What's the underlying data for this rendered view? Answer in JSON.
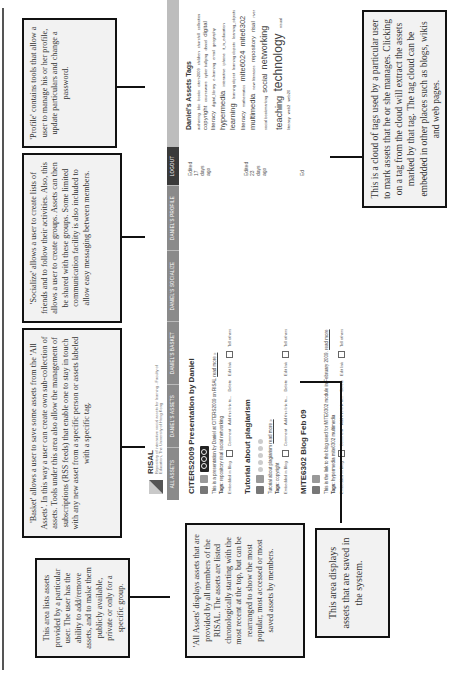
{
  "annotations": {
    "profile": "'Profile' contains tools that allow a user to manage his or her profile, update particulars and change a password.",
    "socialize": "'Socialize' allows a user to create lists of friends and to follow their activities. Also, this allows a user to create groups. Assets can then be shared with these groups. Some limited communication facility is also included to allow easy messaging between members.",
    "basket": "'Basket' allows a user to save some assets from the 'All Assets'. In this way a user can create own sub-collection of assets. Tools under this area also allow the management of subscriptions (RSS feeds) that enable one to stay in touch with any new asset from a specific person or assets labeled with a specific tag.",
    "my_assets": "This area lists assets provided by a particular user. The user has the ability to add/remove assets, and to make them publicly available, private or only for a specific group.",
    "all_assets": "'All Assets' displays assets that are provided by all members of the RISAL. The assets are listed chronologically starting with the most recent at the top, but can be rearranged to show the most popular, most accessed or most saved assets by members.",
    "saved_area": "This area displays assets that are saved in the system.",
    "tag_cloud": "This is a cloud of tags used by a particular user to mark assets that he or she manages. Clicking on a tag from the cloud will extract the assets marked by that tag. The tag cloud can be embedded in other places such as blogs, wikis and web pages."
  },
  "app": {
    "logo_title": "RISAL",
    "logo_subtitle": "Repository of interactive social assets for learning - Faculty of Education, The University of Hong Kong"
  },
  "nav": {
    "items": [
      {
        "label": "ALL ASSETS"
      },
      {
        "label": "DANIEL'S ASSETS"
      },
      {
        "label": "DANIEL'S BASKET"
      },
      {
        "label": "DANIEL'S SOCIALIZE"
      },
      {
        "label": "DANIEL'S PROFILE"
      },
      {
        "label": "LOGOUT"
      }
    ]
  },
  "assets": [
    {
      "title": "CITERS2009 Presentation by Daniel",
      "description": "This is a presentation by Daniel at CITERS2009 on RISAL",
      "read_more": "read more »",
      "tags_label": "Tags:",
      "tags": "repository risal social networking",
      "edited": "Edited 17 days ago",
      "actions": [
        "Embedded in Blog",
        "Comment",
        "Add this link to...",
        "Delete",
        "Edit link",
        "Tell others"
      ]
    },
    {
      "title": "Tutorial about plagiarism",
      "description": "Tutorial about plagiarism",
      "read_more": "read more »",
      "tags_label": "Tags:",
      "tags": "copyright",
      "edited": "Edited 23 days ago",
      "actions": [
        "Embedded in Blog",
        "Comment",
        "Add this link to...",
        "Delete",
        "Edit link",
        "Tell others"
      ]
    },
    {
      "title": "MITE6302 Blog Feb 09",
      "description": "This is the link to the blog used for MITE6302 module in February 2009.",
      "read_more": "read more",
      "tags_label": "Tags:",
      "tags": "hypermedia mite6302 multimedia",
      "edited": "Ed",
      "actions": [
        "Embedded in Blog",
        "Comment",
        "Add this link to...",
        "Delete",
        "Edit link",
        "Tell others"
      ]
    }
  ],
  "tag_cloud": {
    "title": "Daniel's Assets Tags",
    "tags": [
      {
        "text": "authoring",
        "size": "s"
      },
      {
        "text": "bbc",
        "size": "s"
      },
      {
        "text": "books",
        "size": "s"
      },
      {
        "text": "citers2009",
        "size": "s"
      },
      {
        "text": "children",
        "size": "s"
      },
      {
        "text": "churchill",
        "size": "s"
      },
      {
        "text": "collection",
        "size": "s"
      },
      {
        "text": "copyright",
        "size": "m"
      },
      {
        "text": "courseware",
        "size": "s"
      },
      {
        "text": "cyber bullying",
        "size": "s"
      },
      {
        "text": "daniel",
        "size": "s"
      },
      {
        "text": "digital literacy",
        "size": "m"
      },
      {
        "text": "digital_library",
        "size": "s"
      },
      {
        "text": "e-learning",
        "size": "s"
      },
      {
        "text": "email",
        "size": "s"
      },
      {
        "text": "geography",
        "size": "s"
      },
      {
        "text": "hypermedia",
        "size": "l"
      },
      {
        "text": "interactive",
        "size": "s"
      },
      {
        "text": "iphone",
        "size": "s"
      },
      {
        "text": "it_in_education",
        "size": "s"
      },
      {
        "text": "learning",
        "size": "l"
      },
      {
        "text": "learning object",
        "size": "s"
      },
      {
        "text": "learning objects",
        "size": "s"
      },
      {
        "text": "learning_objects",
        "size": "s"
      },
      {
        "text": "literacy",
        "size": "m"
      },
      {
        "text": "mathematics",
        "size": "s"
      },
      {
        "text": "mite6024",
        "size": "l"
      },
      {
        "text": "mite6302",
        "size": "l"
      },
      {
        "text": "multimedia",
        "size": "l"
      },
      {
        "text": "new literacies",
        "size": "s"
      },
      {
        "text": "repository",
        "size": "m"
      },
      {
        "text": "risal",
        "size": "m"
      },
      {
        "text": "river",
        "size": "s"
      },
      {
        "text": "social bookmarking",
        "size": "s"
      },
      {
        "text": "social",
        "size": "l"
      },
      {
        "text": "networking",
        "size": "xl"
      },
      {
        "text": "teaching",
        "size": "xl"
      },
      {
        "text": "technology",
        "size": "xxl"
      },
      {
        "text": "visual literacy",
        "size": "s"
      },
      {
        "text": "web2",
        "size": "s"
      },
      {
        "text": "web20",
        "size": "s"
      }
    ]
  }
}
